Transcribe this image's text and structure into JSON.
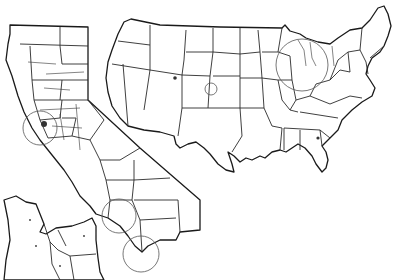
{
  "map": {
    "title": "",
    "colors": {
      "background": "#ffffff",
      "line": "#1a1a1a",
      "circle": "#555555"
    },
    "panels": [
      {
        "name": "usa-states",
        "description": "Contiguous United States state outlines"
      },
      {
        "name": "california-counties",
        "description": "California county outlines"
      },
      {
        "name": "bay-area-inset",
        "description": "San Francisco Bay Area detail inset"
      }
    ],
    "highlight_circles": [
      {
        "name": "great-lakes-circle",
        "cx": 302,
        "cy": 65,
        "r": 26
      },
      {
        "name": "colorado-circle",
        "cx": 211,
        "cy": 89,
        "r": 6
      },
      {
        "name": "bay-area-circle",
        "cx": 40,
        "cy": 128,
        "r": 17
      },
      {
        "name": "los-angeles-circle",
        "cx": 119,
        "cy": 216,
        "r": 17
      },
      {
        "name": "san-diego-circle",
        "cx": 141,
        "cy": 254,
        "r": 18
      }
    ]
  }
}
